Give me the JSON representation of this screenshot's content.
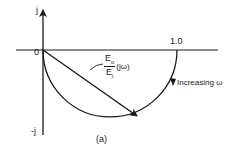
{
  "diagram": {
    "type": "polar-plot",
    "caption": "(a)",
    "axes": {
      "imag_pos_label": "j",
      "imag_neg_label": "-j",
      "origin_label": "0",
      "real_mark_label": "1.0"
    },
    "vector_label": {
      "numerator": "E",
      "numerator_sub": "o",
      "denominator": "E",
      "denominator_sub": "i",
      "argument": "(jω)"
    },
    "curve_annotation": "Increasing ω",
    "colors": {
      "ink": "#1a1a1a",
      "background": "#ffffff"
    }
  }
}
